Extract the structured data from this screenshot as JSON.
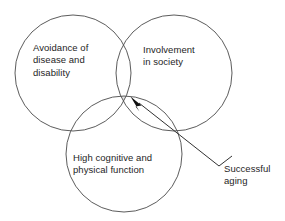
{
  "diagram": {
    "type": "venn",
    "background_color": "#ffffff",
    "stroke_color": "#4a4a4a",
    "shade_color": "#e4e4e4",
    "text_color": "#1e1e1e",
    "circles": [
      {
        "id": "avoidance",
        "label": "Avoidance of\ndisease and\ndisability",
        "cx": 73,
        "cy": 73,
        "r": 58
      },
      {
        "id": "involvement",
        "label": "Involvement\nin society",
        "cx": 174,
        "cy": 73,
        "r": 58
      },
      {
        "id": "function",
        "label": "High cognitive and\nphysical function",
        "cx": 124,
        "cy": 154,
        "r": 58
      }
    ],
    "callout": {
      "label": "Successful\naging",
      "points_to": "triple-intersection",
      "arrow_tip_x": 131,
      "arrow_tip_y": 97,
      "arrow_tail_x": 219,
      "arrow_tail_y": 166
    }
  }
}
